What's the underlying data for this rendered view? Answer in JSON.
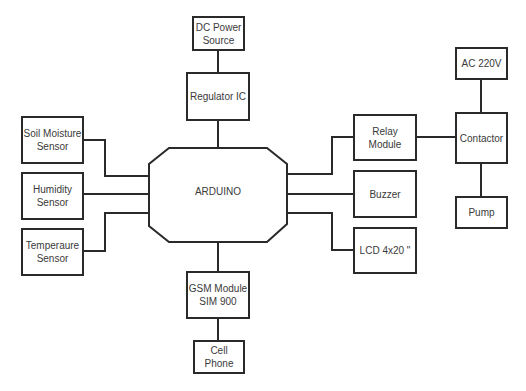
{
  "diagram": {
    "hub": {
      "label": "ARDUINO"
    },
    "nodes": {
      "dc_power": {
        "label": "DC Power\nSource"
      },
      "regulator": {
        "label": "Regulator IC"
      },
      "soil_moisture": {
        "label": "Soil Moisture\nSensor"
      },
      "humidity": {
        "label": "Humidity\nSensor"
      },
      "temperature": {
        "label": "Temperaure\nSensor"
      },
      "relay": {
        "label": "Relay\nModule"
      },
      "buzzer": {
        "label": "Buzzer"
      },
      "lcd": {
        "label": "LCD 4x20 \""
      },
      "ac_220v": {
        "label": "AC 220V"
      },
      "contactor": {
        "label": "Contactor"
      },
      "pump": {
        "label": "Pump"
      },
      "gsm": {
        "label": "GSM Module\nSIM 900"
      },
      "cell_phone": {
        "label": "Cell Phone"
      }
    },
    "edges": [
      [
        "dc_power",
        "regulator"
      ],
      [
        "regulator",
        "arduino"
      ],
      [
        "soil_moisture",
        "arduino"
      ],
      [
        "humidity",
        "arduino"
      ],
      [
        "temperature",
        "arduino"
      ],
      [
        "arduino",
        "relay"
      ],
      [
        "arduino",
        "buzzer"
      ],
      [
        "arduino",
        "lcd"
      ],
      [
        "relay",
        "contactor"
      ],
      [
        "ac_220v",
        "contactor"
      ],
      [
        "contactor",
        "pump"
      ],
      [
        "arduino",
        "gsm"
      ],
      [
        "gsm",
        "cell_phone"
      ]
    ],
    "colors": {
      "line": "#2a2a2a",
      "text": "#3a3a3a",
      "background": "#ffffff"
    }
  }
}
